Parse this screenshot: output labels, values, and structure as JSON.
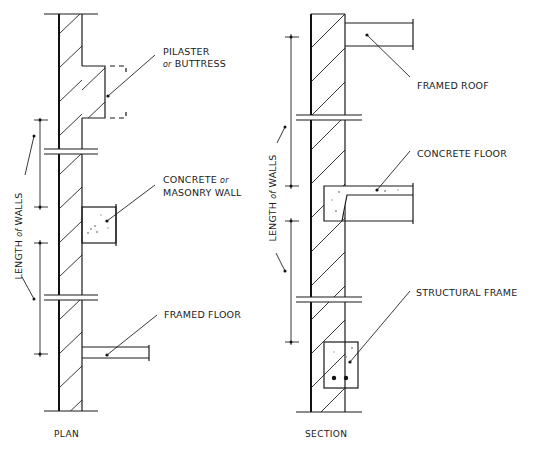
{
  "diagram": {
    "plan": {
      "title": "PLAN",
      "dimension_label_main": "LENGTH",
      "dimension_label_of": "of",
      "dimension_label_end": "WALLS",
      "callouts": [
        {
          "line1": "PILASTER",
          "line2_prefix": "or",
          "line2": "BUTTRESS"
        },
        {
          "line1_main": "CONCRETE",
          "line1_suffix": "or",
          "line2": "MASONRY WALL"
        },
        {
          "line1": "FRAMED FLOOR"
        }
      ]
    },
    "section": {
      "title": "SECTION",
      "dimension_label_main": "LENGTH",
      "dimension_label_of": "of",
      "dimension_label_end": "WALLS",
      "callouts": [
        {
          "line1": "FRAMED ROOF"
        },
        {
          "line1": "CONCRETE FLOOR"
        },
        {
          "line1": "STRUCTURAL FRAME"
        }
      ]
    }
  }
}
